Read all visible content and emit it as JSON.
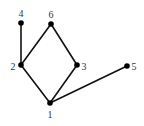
{
  "diagram": {
    "type": "graph",
    "nodes": [
      {
        "id": "1",
        "label": "1",
        "x": 50,
        "y": 103,
        "label_x": 50,
        "label_y": 114,
        "anchor": "middle"
      },
      {
        "id": "2",
        "label": "2",
        "x": 21,
        "y": 65,
        "label_x": 13,
        "label_y": 66,
        "anchor": "middle"
      },
      {
        "id": "3",
        "label": "3",
        "x": 77,
        "y": 65,
        "label_x": 84,
        "label_y": 66,
        "anchor": "middle"
      },
      {
        "id": "4",
        "label": "4",
        "x": 21,
        "y": 23,
        "label_x": 21,
        "label_y": 13,
        "anchor": "middle"
      },
      {
        "id": "5",
        "label": "5",
        "x": 127,
        "y": 66,
        "label_x": 134,
        "label_y": 66,
        "anchor": "middle"
      },
      {
        "id": "6",
        "label": "6",
        "x": 51,
        "y": 24,
        "label_x": 51,
        "label_y": 14,
        "anchor": "middle"
      }
    ],
    "edges": [
      {
        "from": "4",
        "to": "2"
      },
      {
        "from": "2",
        "to": "6"
      },
      {
        "from": "6",
        "to": "3"
      },
      {
        "from": "2",
        "to": "1"
      },
      {
        "from": "3",
        "to": "1"
      },
      {
        "from": "1",
        "to": "5"
      }
    ],
    "colors": {
      "edge": "#111111",
      "node": "#000000",
      "label": "#333333",
      "background": "#ffffff"
    }
  }
}
